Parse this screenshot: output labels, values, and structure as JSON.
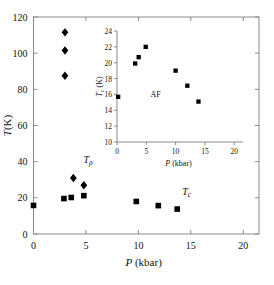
{
  "figure": {
    "background_color": "#ffffff",
    "marker_color": "#000000",
    "axis_color": "#8a8a8a"
  },
  "chart_data": [
    {
      "id": "main",
      "type": "scatter",
      "title": "",
      "xlabel": "P (kbar)",
      "xlabel_symbol": "P",
      "xlabel_unit": "(kbar)",
      "ylabel": "T (K)",
      "ylabel_symbol": "T",
      "ylabel_unit": "(K)",
      "xlim": [
        0,
        21.5
      ],
      "ylim": [
        0,
        120
      ],
      "xticks": [
        0,
        5,
        10,
        15,
        20
      ],
      "xticklabels": [
        "0",
        "5",
        "10",
        "15",
        "20"
      ],
      "yticks": [
        0,
        20,
        40,
        60,
        80,
        100,
        120
      ],
      "yticklabels": [
        "0",
        "20",
        "40",
        "60",
        "80",
        "100",
        "120"
      ],
      "grid": false,
      "legend": "none",
      "frame": "box",
      "tick_direction": "in",
      "series": [
        {
          "name": "T_rho",
          "marker": "diamond",
          "points": [
            {
              "x": 3.0,
              "y": 111.5
            },
            {
              "x": 3.0,
              "y": 101.5
            },
            {
              "x": 3.0,
              "y": 87.5
            },
            {
              "x": 3.8,
              "y": 31.0
            },
            {
              "x": 4.8,
              "y": 27.0
            }
          ]
        },
        {
          "name": "T_c",
          "marker": "square",
          "points": [
            {
              "x": 0.0,
              "y": 15.8
            },
            {
              "x": 2.9,
              "y": 19.6
            },
            {
              "x": 3.6,
              "y": 20.2
            },
            {
              "x": 4.8,
              "y": 21.2
            },
            {
              "x": 9.8,
              "y": 18.0
            },
            {
              "x": 11.9,
              "y": 15.7
            },
            {
              "x": 13.7,
              "y": 13.8
            }
          ]
        }
      ],
      "annotations": [
        {
          "name": "t-rho-label",
          "text": "Tρ",
          "symbol": "T",
          "subscript": "ρ",
          "x": 5.2,
          "y": 39.5
        },
        {
          "name": "t-c-label",
          "text": "Tc",
          "symbol": "T",
          "subscript": "c",
          "x": 14.6,
          "y": 21.5
        }
      ]
    },
    {
      "id": "inset",
      "type": "scatter",
      "title": "",
      "xlabel": "P (kbar)",
      "xlabel_symbol": "P",
      "xlabel_unit": "(kbar)",
      "ylabel": "Tc (K)",
      "ylabel_symbol": "T",
      "ylabel_subscript": "c",
      "ylabel_unit": "(K)",
      "xlim": [
        0,
        21.5
      ],
      "ylim": [
        10,
        24
      ],
      "xticks": [
        0,
        5,
        10,
        15,
        20
      ],
      "xticklabels": [
        "0",
        "5",
        "10",
        "15",
        "20"
      ],
      "yticks": [
        10,
        12,
        14,
        16,
        18,
        20,
        22,
        24
      ],
      "yticklabels": [
        "10",
        "12",
        "14",
        "16",
        "18",
        "20",
        "22",
        "24"
      ],
      "grid": false,
      "legend": "none",
      "frame": "left-bottom",
      "tick_direction": "out",
      "series": [
        {
          "name": "Tc",
          "marker": "square",
          "points": [
            {
              "x": 0.2,
              "y": 15.7
            },
            {
              "x": 3.1,
              "y": 19.9
            },
            {
              "x": 3.7,
              "y": 20.7
            },
            {
              "x": 4.9,
              "y": 22.0
            },
            {
              "x": 10.0,
              "y": 19.0
            },
            {
              "x": 12.0,
              "y": 17.1
            },
            {
              "x": 13.9,
              "y": 15.1
            }
          ]
        }
      ],
      "annotations": [
        {
          "name": "af-label",
          "text": "AF",
          "x": 6.6,
          "y": 15.7
        }
      ]
    }
  ]
}
